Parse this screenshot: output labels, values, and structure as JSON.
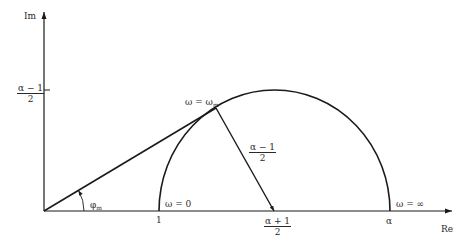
{
  "axes": {
    "x_label": "Re",
    "y_label": "Im"
  },
  "labels": {
    "im_tick_num": "α − 1",
    "im_tick_den": "2",
    "omega_m_prefix": "ω = ω",
    "omega_m_sub": "m",
    "radius_num": "α − 1",
    "radius_den": "2",
    "phi_m_base": "φ",
    "phi_m_sub": "m",
    "omega_zero": "ω = 0",
    "omega_inf": "ω = ∞",
    "tick_one": "1",
    "center_num": "α + 1",
    "center_den": "2",
    "tick_alpha": "α"
  },
  "geometry": {
    "origin": [
      44,
      211
    ],
    "arc_start_x": 159,
    "arc_end_x": 390,
    "arc_center_x": 274,
    "arc_top_y": 90,
    "tangent_point": [
      216,
      108
    ],
    "line_color": "#1a1a1a"
  }
}
